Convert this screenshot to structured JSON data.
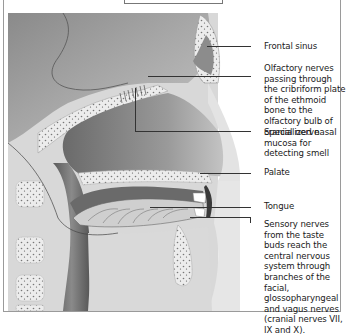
{
  "diagram": {
    "type": "anatomical-cross-section",
    "colors": {
      "background": "#ffffff",
      "tissue_light": "#e6e6e6",
      "tissue_mid": "#b3b3b3",
      "tissue_dark": "#6e6e6e",
      "bone": "#eeeeee",
      "leader_line": "#333333",
      "text": "#1a1a1a"
    },
    "labels": [
      {
        "id": "frontal-sinus",
        "text": "Frontal sinus"
      },
      {
        "id": "olfactory-nerves",
        "text": "Olfactory nerves passing through the cribriform plate of the ethmoid bone to the olfactory bulb of cranial nerve"
      },
      {
        "id": "nasal-mucosa",
        "text": "Specialized nasal mucosa for detecting smell"
      },
      {
        "id": "palate",
        "text": "Palate"
      },
      {
        "id": "tongue",
        "text": "Tongue"
      },
      {
        "id": "sensory-nerves",
        "text": "Sensory nerves from the taste buds reach the central nervous system through branches of the facial, glossopharyngeal and vagus nerves (cranial nerves VII, IX and X)."
      }
    ]
  }
}
